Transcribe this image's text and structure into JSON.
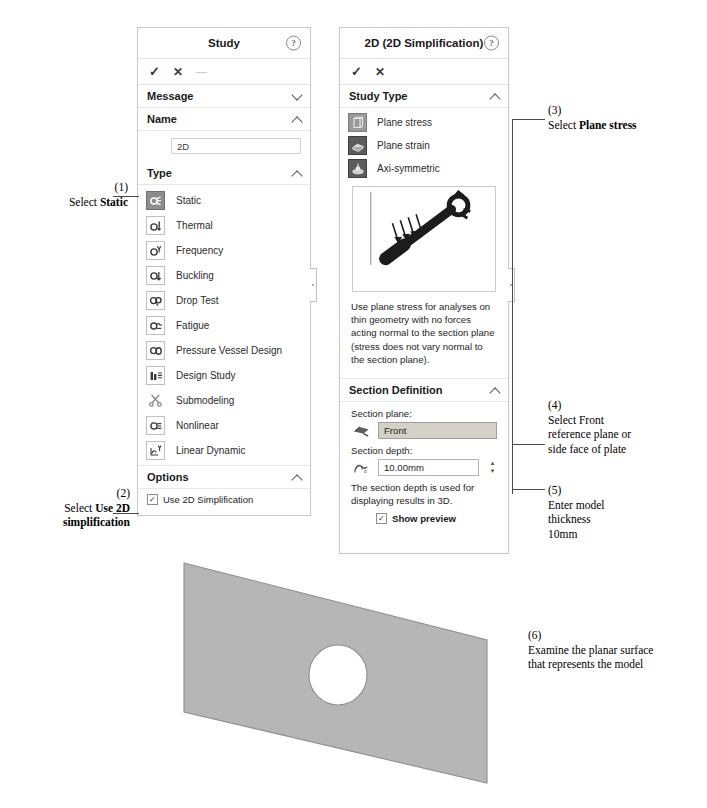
{
  "study_panel": {
    "title": "Study",
    "help_icon": "question-mark-icon",
    "commands": [
      {
        "name": "accept",
        "glyph": "✓"
      },
      {
        "name": "cancel",
        "glyph": "✕"
      },
      {
        "name": "pin",
        "glyph": "—"
      }
    ],
    "sections": {
      "message": {
        "label": "Message",
        "state": "collapsed"
      },
      "name": {
        "label": "Name",
        "state": "expanded",
        "value": "2D"
      },
      "type": {
        "label": "Type",
        "state": "expanded"
      },
      "options": {
        "label": "Options",
        "state": "expanded"
      }
    },
    "type_items": [
      {
        "label": "Static",
        "icon": "static-study-icon",
        "selected": true
      },
      {
        "label": "Thermal",
        "icon": "thermal-study-icon",
        "selected": false
      },
      {
        "label": "Frequency",
        "icon": "frequency-study-icon",
        "selected": false
      },
      {
        "label": "Buckling",
        "icon": "buckling-study-icon",
        "selected": false
      },
      {
        "label": "Drop Test",
        "icon": "drop-test-study-icon",
        "selected": false
      },
      {
        "label": "Fatigue",
        "icon": "fatigue-study-icon",
        "selected": false
      },
      {
        "label": "Pressure Vessel Design",
        "icon": "pressure-vessel-icon",
        "selected": false
      },
      {
        "label": "Design Study",
        "icon": "design-study-icon",
        "selected": false
      },
      {
        "label": "Submodeling",
        "icon": "submodeling-icon",
        "selected": false
      },
      {
        "label": "Nonlinear",
        "icon": "nonlinear-study-icon",
        "selected": false
      },
      {
        "label": "Linear Dynamic",
        "icon": "linear-dynamic-icon",
        "selected": false
      }
    ],
    "option_checkbox": {
      "label": "Use 2D Simplification",
      "checked": true,
      "check_glyph": "✓"
    }
  },
  "twod_panel": {
    "title": "2D (2D Simplification)",
    "help_icon": "question-mark-icon",
    "commands": [
      {
        "name": "accept",
        "glyph": "✓"
      },
      {
        "name": "cancel",
        "glyph": "✕"
      }
    ],
    "study_type": {
      "label": "Study Type",
      "state": "expanded",
      "items": [
        {
          "label": "Plane stress",
          "icon": "plane-stress-icon",
          "selected": true
        },
        {
          "label": "Plane strain",
          "icon": "plane-strain-icon",
          "selected": false
        },
        {
          "label": "Axi-symmetric",
          "icon": "axisymmetric-icon",
          "selected": false
        }
      ]
    },
    "preview_image_name": "plane-stress-wrench-illustration",
    "description": "Use plane stress for analyses on thin geometry with no forces acting normal to the section plane (stress does not vary normal to the section plane).",
    "section_definition": {
      "label": "Section Definition",
      "state": "expanded",
      "plane_label": "Section plane:",
      "plane_icon": "reference-plane-icon",
      "plane_value": "Front",
      "depth_label": "Section depth:",
      "depth_icon": "section-depth-icon",
      "depth_value": "10.00mm",
      "note": "The section depth is used for displaying results in 3D.",
      "show_preview": {
        "label": "Show preview",
        "checked": true,
        "check_glyph": "✓"
      }
    }
  },
  "annotations": [
    {
      "id": "1",
      "number": "(1)",
      "lines": [
        {
          "plain": "Select ",
          "bold": "Static"
        }
      ]
    },
    {
      "id": "2",
      "number": "(2)",
      "lines": [
        {
          "plain": "Select ",
          "bold": "Use 2D"
        },
        {
          "plain": "",
          "bold": "simplification"
        }
      ]
    },
    {
      "id": "3",
      "number": "(3)",
      "lines": [
        {
          "plain": "Select ",
          "bold": "Plane stress"
        }
      ]
    },
    {
      "id": "4",
      "number": "(4)",
      "lines": [
        {
          "plain": "Select Front",
          "bold": ""
        },
        {
          "plain": "reference plane or",
          "bold": ""
        },
        {
          "plain": "side face of plate",
          "bold": ""
        }
      ]
    },
    {
      "id": "5",
      "number": "(5)",
      "lines": [
        {
          "plain": "Enter model",
          "bold": ""
        },
        {
          "plain": "thickness",
          "bold": ""
        },
        {
          "plain": "10mm",
          "bold": ""
        }
      ]
    },
    {
      "id": "6",
      "number": "(6)",
      "lines": [
        {
          "plain": "Examine the planar surface",
          "bold": ""
        },
        {
          "plain": "that represents the model",
          "bold": ""
        }
      ]
    }
  ],
  "plate_figure": {
    "name": "planar-plate-with-hole",
    "fill_color": "#b6b6b6",
    "edge_color": "#8a8a8a",
    "hole_color": "#ffffff"
  }
}
